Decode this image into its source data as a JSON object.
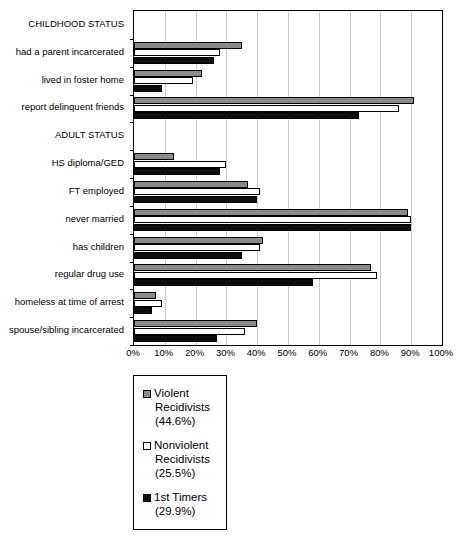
{
  "chart_data": {
    "type": "bar",
    "orientation": "horizontal",
    "title": "",
    "subtitle": "",
    "xlabel": "",
    "ylabel": "",
    "xlim": [
      0,
      100
    ],
    "xtick_labels": [
      "0%",
      "10%",
      "20%",
      "30%",
      "40%",
      "50%",
      "60%",
      "70%",
      "80%",
      "90%",
      "100%"
    ],
    "xtick_values": [
      0,
      10,
      20,
      30,
      40,
      50,
      60,
      70,
      80,
      90,
      100
    ],
    "grid": "vertical",
    "legend_position": "below-left",
    "categories": [
      "CHILDHOOD STATUS",
      "had a parent incarcerated",
      "lived in foster home",
      "report delinquent friends",
      "ADULT STATUS",
      "HS diploma/GED",
      "FT employed",
      "never married",
      "has children",
      "regular drug use",
      "homeless at time of arrest",
      "spouse/sibling incarcerated"
    ],
    "section_headers": [
      "CHILDHOOD STATUS",
      "ADULT STATUS"
    ],
    "series": [
      {
        "name": "Violent Recidivists",
        "color": "#8a8a8a",
        "values": [
          null,
          35,
          22,
          91,
          null,
          13,
          37,
          89,
          42,
          77,
          7,
          40
        ]
      },
      {
        "name": "Nonviolent Recidivists",
        "color": "#ffffff",
        "values": [
          null,
          28,
          19,
          86,
          null,
          30,
          41,
          90,
          41,
          79,
          9,
          36
        ]
      },
      {
        "name": "1st Timers",
        "color": "#0d0d0d",
        "values": [
          null,
          26,
          9,
          73,
          null,
          28,
          40,
          90,
          35,
          58,
          6,
          27
        ]
      }
    ]
  },
  "legend": {
    "entries": [
      {
        "swatch": "violent",
        "name_line1": "Violent",
        "name_line2": "Recidivists",
        "pct": "(44.6%)"
      },
      {
        "swatch": "nonviolent",
        "name_line1": "Nonviolent",
        "name_line2": "Recidivists",
        "pct": "(25.5%)"
      },
      {
        "swatch": "timers",
        "name_line1": "1st Timers",
        "name_line2": "",
        "pct": "(29.9%)"
      }
    ]
  }
}
